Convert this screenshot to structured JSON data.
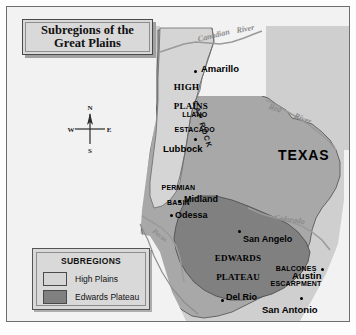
{
  "figure": {
    "title": "Subregions of the\nGreat Plains",
    "title_line1": "Subregions of the",
    "title_line2": "Great Plains"
  },
  "colors": {
    "page_background": "#fdfdfd",
    "map_background": "#cfcfcf",
    "outside_state": "#f2f2f2",
    "texas_body": "#a8a8a8",
    "high_plains": "#d5d5d5",
    "edwards_plateau": "#808080",
    "river": "#8a8a8a",
    "border": "#4a4a4a",
    "text": "#111111"
  },
  "compass": {
    "north": "N",
    "south": "S",
    "east": "E",
    "west": "W"
  },
  "legend": {
    "title": "SUBREGIONS",
    "items": [
      {
        "label": "High Plains",
        "color": "#d5d5d5"
      },
      {
        "label": "Edwards Plateau",
        "color": "#808080"
      }
    ]
  },
  "map": {
    "state_label": "TEXAS",
    "regions": [
      {
        "name": "HIGH\nPLAINS",
        "line1": "HIGH",
        "line2": "PLAINS",
        "style": "serif"
      },
      {
        "name": "LLANO\nESTACADO",
        "line1": "LLANO",
        "line2": "ESTACADO",
        "style": "sans"
      },
      {
        "name": "PERMIAN\nBASIN",
        "line1": "PERMIAN",
        "line2": "BASIN",
        "style": "sans"
      },
      {
        "name": "EDWARDS\nPLATEAU",
        "line1": "EDWARDS",
        "line2": "PLATEAU",
        "style": "serif"
      },
      {
        "name": "BALCONES\nESCARPMENT",
        "line1": "BALCONES",
        "line2": "ESCARPMENT",
        "style": "sans"
      },
      {
        "name": "CAP ROCK",
        "line1": "CAP ROCK",
        "style": "rotated"
      }
    ],
    "cities": [
      {
        "name": "Amarillo"
      },
      {
        "name": "Lubbock"
      },
      {
        "name": "Midland"
      },
      {
        "name": "Odessa"
      },
      {
        "name": "San Angelo"
      },
      {
        "name": "Austin"
      },
      {
        "name": "Del Rio"
      },
      {
        "name": "San Antonio"
      }
    ],
    "rivers": [
      {
        "name": "Canadian"
      },
      {
        "name": "River"
      },
      {
        "name": "Red"
      },
      {
        "name": "River"
      },
      {
        "name": "Colorado"
      },
      {
        "name": "Pecos"
      }
    ]
  }
}
